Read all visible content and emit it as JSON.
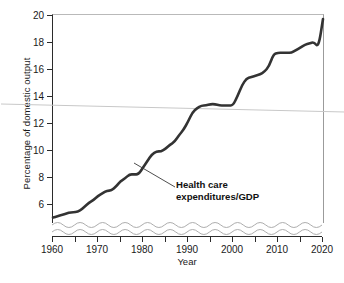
{
  "chart_data": {
    "type": "line",
    "title": "",
    "xlabel": "Year",
    "ylabel": "Percentage of domestic output",
    "xlim": [
      1960,
      2020
    ],
    "ylim": [
      4.6,
      20
    ],
    "grid": false,
    "legend": "none",
    "y_axis_truncated": true,
    "y_break_symbol": "wavy-band",
    "x_ticks_major": [
      1960,
      1970,
      1980,
      1990,
      2000,
      2010,
      2020
    ],
    "x_ticks_minor": [
      1965,
      1975,
      1985,
      1995,
      2005,
      2015
    ],
    "y_ticks": [
      6,
      8,
      10,
      12,
      14,
      16,
      18,
      20
    ],
    "series": [
      {
        "name": "Health care expenditures/GDP",
        "color": "#333333",
        "x": [
          1960,
          1961,
          1962,
          1963,
          1964,
          1965,
          1966,
          1967,
          1968,
          1969,
          1970,
          1971,
          1972,
          1973,
          1974,
          1975,
          1976,
          1977,
          1978,
          1979,
          1980,
          1981,
          1982,
          1983,
          1984,
          1985,
          1986,
          1987,
          1988,
          1989,
          1990,
          1991,
          1992,
          1993,
          1994,
          1995,
          1996,
          1997,
          1998,
          1999,
          2000,
          2001,
          2002,
          2003,
          2004,
          2005,
          2006,
          2007,
          2008,
          2009,
          2010,
          2011,
          2012,
          2013,
          2014,
          2015,
          2016,
          2017,
          2018,
          2019,
          2020
        ],
        "values": [
          5.0,
          5.1,
          5.2,
          5.3,
          5.4,
          5.4,
          5.5,
          5.8,
          6.1,
          6.3,
          6.6,
          6.8,
          7.0,
          7.0,
          7.3,
          7.7,
          7.9,
          8.2,
          8.2,
          8.2,
          8.7,
          9.2,
          9.7,
          9.9,
          9.9,
          10.1,
          10.4,
          10.6,
          11.1,
          11.5,
          12.1,
          12.8,
          13.1,
          13.3,
          13.3,
          13.4,
          13.4,
          13.3,
          13.3,
          13.3,
          13.3,
          14.0,
          14.8,
          15.3,
          15.4,
          15.5,
          15.6,
          15.8,
          16.2,
          17.1,
          17.2,
          17.2,
          17.2,
          17.2,
          17.4,
          17.6,
          17.8,
          17.9,
          18.0,
          17.6,
          19.7
        ],
        "start_value": 5.0,
        "end_value": 19.7,
        "units": "percent of GDP"
      }
    ],
    "annotations": [
      {
        "text_line1": "Health care",
        "text_line2": "expenditures/GDP",
        "points_to_year": 1982,
        "points_to_value": 9.5,
        "bold": true
      }
    ]
  },
  "axes": {
    "y_title": "Percentage of domestic output",
    "x_title": "Year",
    "y_tick_labels": [
      "6",
      "8",
      "10",
      "12",
      "14",
      "16",
      "18",
      "20"
    ],
    "x_tick_labels": [
      "1960",
      "1970",
      "1980",
      "1990",
      "2000",
      "2010",
      "2020"
    ]
  },
  "annotation": {
    "line1": "Health care",
    "line2": "expenditures/GDP"
  },
  "colors": {
    "series": "#333333",
    "axis": "#2b2b2b",
    "frame": "#b9b9b9",
    "break": "#aeaeae",
    "artifact": "#c8c8c8"
  }
}
